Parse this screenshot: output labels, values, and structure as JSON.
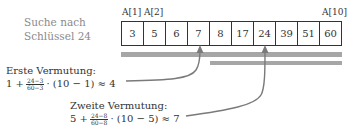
{
  "description": {
    "line1": "Suche nach",
    "line2": "Schlüssel 24"
  },
  "array": {
    "index_labels": [
      {
        "label": "A[1]",
        "cell": 0
      },
      {
        "label": "A[2]",
        "cell": 1
      },
      {
        "label": "A[10]",
        "cell": 9
      }
    ],
    "values": [
      "3",
      "5",
      "6",
      "7",
      "8",
      "17",
      "24",
      "39",
      "51",
      "60"
    ]
  },
  "search_ranges": [
    {
      "name": "range-1",
      "from_index": 1,
      "to_index": 10
    },
    {
      "name": "range-2",
      "from_index": 5,
      "to_index": 10
    }
  ],
  "guesses": [
    {
      "title": "Erste Vermutung:",
      "prefix": "1 +",
      "frac_num": "24−3",
      "frac_den": "60−3",
      "suffix": "· (10 − 1) ≈ 4",
      "points_to_index": 4
    },
    {
      "title": "Zweite Vermutung:",
      "prefix": "5 +",
      "frac_num": "24−8",
      "frac_den": "60−8",
      "suffix": "· (10 − 5) ≈ 7",
      "points_to_index": 7
    }
  ],
  "colors": {
    "bar": "#a6a6a6",
    "arrow": "#7a7a7a",
    "text": "#333333",
    "muted_text": "#8a8a8a"
  }
}
